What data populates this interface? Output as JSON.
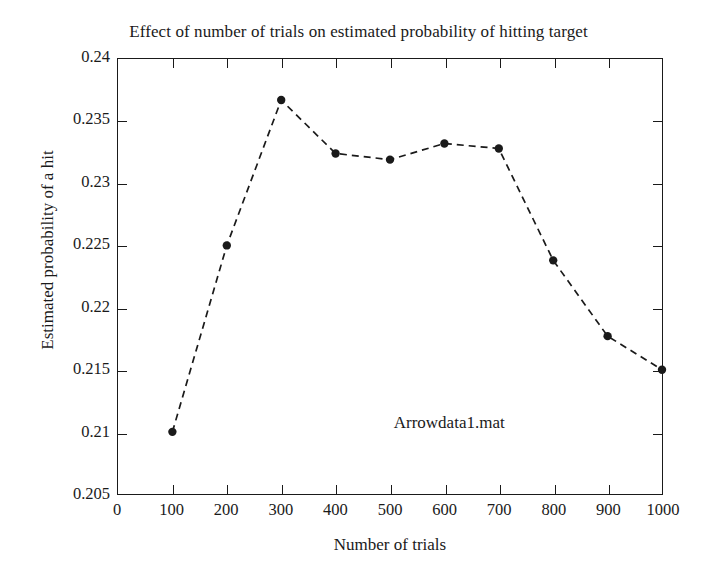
{
  "chart_data": {
    "type": "line",
    "title": "Effect of number of trials on estimated probability of hitting target",
    "xlabel": "Number of trials",
    "ylabel": "Estimated probability of a hit",
    "x": [
      100,
      200,
      300,
      400,
      500,
      600,
      700,
      800,
      900,
      1000
    ],
    "values": [
      0.21,
      0.225,
      0.2367,
      0.2324,
      0.2319,
      0.2332,
      0.2328,
      0.2238,
      0.2177,
      0.215
    ],
    "series": [
      {
        "name": "Arrowdata1.mat",
        "values": [
          0.21,
          0.225,
          0.2367,
          0.2324,
          0.2319,
          0.2332,
          0.2328,
          0.2238,
          0.2177,
          0.215
        ]
      }
    ],
    "xlim": [
      0,
      1000
    ],
    "ylim": [
      0.205,
      0.24
    ],
    "xticks": [
      0,
      100,
      200,
      300,
      400,
      500,
      600,
      700,
      800,
      900,
      1000
    ],
    "xtick_labels": [
      "0",
      "100",
      "200",
      "300",
      "400",
      "500",
      "600",
      "700",
      "800",
      "900",
      "1000"
    ],
    "yticks": [
      0.205,
      0.21,
      0.215,
      0.22,
      0.225,
      0.23,
      0.235,
      0.24
    ],
    "ytick_labels": [
      "0.205",
      "0.21",
      "0.215",
      "0.22",
      "0.225",
      "0.23",
      "0.235",
      "0.24"
    ],
    "grid": false,
    "legend": "none",
    "annotations": [
      {
        "text": "Arrowdata1.mat",
        "x": 690,
        "y": 0.2107
      }
    ],
    "style": {
      "line_style": "dashed",
      "line_color": "#1a1a1a",
      "marker": "filled-circle",
      "marker_color": "#1a1a1a",
      "background": "#ffffff",
      "axis_color": "#1a1a1a"
    }
  }
}
